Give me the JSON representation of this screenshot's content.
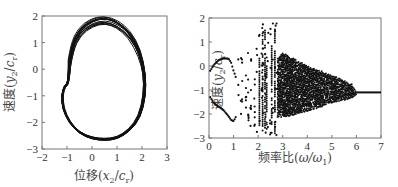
{
  "chart_data": [
    {
      "type": "line",
      "title": "",
      "xlabel": "位移(x2/cr)",
      "ylabel": "速度(y2/cr)",
      "xlim": [
        -2,
        3
      ],
      "ylim": [
        -3,
        2
      ],
      "xticks": [
        "-2",
        "-1",
        "0",
        "1",
        "2",
        "3"
      ],
      "yticks": [
        "2",
        "1",
        "0",
        "-1",
        "-2",
        "-3"
      ],
      "grid": false,
      "description": "Phase portrait: dense bundle of closed orbits forming a kidney/heart-shaped attractor",
      "series": [
        {
          "name": "orbit",
          "x": [
            -0.9,
            -0.8,
            -0.5,
            0.0,
            0.5,
            1.0,
            1.5,
            1.9,
            2.1,
            2.1,
            1.9,
            1.5,
            1.0,
            0.5,
            0.0,
            -0.5,
            -0.9,
            -1.15,
            -1.2,
            -1.1,
            -0.95,
            -0.9
          ],
          "y": [
            0.2,
            0.8,
            1.4,
            1.75,
            1.85,
            1.7,
            1.3,
            0.6,
            -0.2,
            -1.0,
            -1.8,
            -2.3,
            -2.6,
            -2.65,
            -2.6,
            -2.4,
            -2.0,
            -1.5,
            -1.0,
            -0.65,
            -0.55,
            0.2
          ]
        }
      ]
    },
    {
      "type": "scatter",
      "title": "",
      "xlabel": "频率比(ω/ω1)",
      "ylabel": "速度(y2/cr)",
      "xlim": [
        0,
        7
      ],
      "ylim": [
        -3,
        2
      ],
      "xticks": [
        "0",
        "1",
        "2",
        "3",
        "4",
        "5",
        "6",
        "7"
      ],
      "yticks": [
        "2",
        "1",
        "0",
        "-1",
        "-2",
        "-3"
      ],
      "grid": false,
      "description": "Bifurcation diagram: two smooth branches for ω/ω1 < 1, scattered periodic windows 1–2.8, dense chaotic band 2.8–6 narrowing, single value ≈ -1.1 for ω/ω1 > 6",
      "series": [
        {
          "name": "upper-branch",
          "x": [
            0.05,
            0.2,
            0.4,
            0.6,
            0.8,
            0.9,
            1.0,
            1.1
          ],
          "y": [
            -0.2,
            0.05,
            0.25,
            0.32,
            0.3,
            0.15,
            -0.2,
            -0.5
          ]
        },
        {
          "name": "lower-branch",
          "x": [
            0.05,
            0.2,
            0.4,
            0.6,
            0.8,
            0.9,
            1.0,
            1.1
          ],
          "y": [
            -1.3,
            -1.55,
            -1.7,
            -1.85,
            -2.1,
            -2.25,
            -2.3,
            -2.1
          ]
        },
        {
          "name": "chaotic-band-envelope-upper",
          "x": [
            2.8,
            3.0,
            3.5,
            4.0,
            4.5,
            5.0,
            5.5,
            5.8,
            6.0
          ],
          "y": [
            0.3,
            0.55,
            0.3,
            0.0,
            -0.2,
            -0.4,
            -0.6,
            -0.75,
            -1.05
          ]
        },
        {
          "name": "chaotic-band-envelope-lower",
          "x": [
            2.8,
            3.0,
            3.5,
            4.0,
            4.5,
            5.0,
            5.5,
            5.8,
            6.0
          ],
          "y": [
            -2.1,
            -2.1,
            -2.0,
            -1.85,
            -1.7,
            -1.5,
            -1.4,
            -1.3,
            -1.15
          ]
        },
        {
          "name": "period-one-tail",
          "x": [
            6.0,
            6.5,
            7.0
          ],
          "y": [
            -1.1,
            -1.1,
            -1.1
          ]
        }
      ]
    }
  ]
}
